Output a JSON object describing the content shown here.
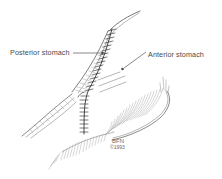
{
  "figure": {
    "type": "medical-illustration",
    "medium": "pen-and-ink line drawing",
    "background_color": "#ffffff",
    "ink_color": "#3b3b3b",
    "width": 222,
    "height": 179
  },
  "labels": [
    {
      "id": "posterior",
      "text": "Posterior stomach",
      "text_x": 10,
      "text_y": 53,
      "anchor": "start",
      "leader_path": "M 73 53 L 101 53",
      "dot_x": 102.5,
      "dot_y": 53,
      "dot_r": 1.3
    },
    {
      "id": "anterior",
      "text": "Anterior stomach",
      "text_x": 148,
      "text_y": 55,
      "anchor": "start",
      "leader_path": "M 146 52 L 124 68",
      "dot_x": 122.5,
      "dot_y": 69,
      "dot_r": 1.3
    }
  ],
  "signature": {
    "initials": "BFN",
    "year": "©1993",
    "x": 112,
    "y": 143
  },
  "annotations": {
    "suture_line_label": "staple line",
    "serosa_hatching_label": "serosal surface shading"
  }
}
